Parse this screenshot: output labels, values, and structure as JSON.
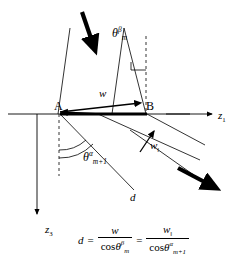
{
  "figure": {
    "type": "geometry-diagram",
    "background_color": "#ffffff",
    "line_color": "#000000"
  },
  "points": {
    "a_label": "A",
    "b_label": "B"
  },
  "axes": {
    "horizontal": {
      "label": "z",
      "subscript": "1",
      "direction": "right"
    },
    "vertical": {
      "label": "z",
      "subscript": "3",
      "direction": "down"
    }
  },
  "vectors": {
    "w": {
      "label": "w",
      "subscript": ""
    },
    "w_parallel": {
      "label": "w",
      "subscript": "‖"
    },
    "d": {
      "label": "d"
    }
  },
  "angles": {
    "theta_beta": {
      "symbol": "θ",
      "superscript": "β",
      "subscript": "m"
    },
    "theta_alpha": {
      "symbol": "θ",
      "superscript": "α",
      "subscript": "m+1"
    }
  },
  "equation": {
    "lhs": "d",
    "equals": "=",
    "term1": {
      "numerator": "w",
      "denominator_fn": "cos",
      "denominator_sym": "θ",
      "denominator_sup": "β",
      "denominator_sub": "m"
    },
    "equals2": "=",
    "term2": {
      "numerator": "w",
      "numerator_sub": "‖",
      "denominator_fn": "cos",
      "denominator_sym": "θ",
      "denominator_sup": "α",
      "denominator_sub": "m+1"
    }
  },
  "arrows": {
    "incoming_bold": "thick-arrow-down-right-top",
    "outgoing_bold": "thick-arrow-down-right-bottom"
  }
}
